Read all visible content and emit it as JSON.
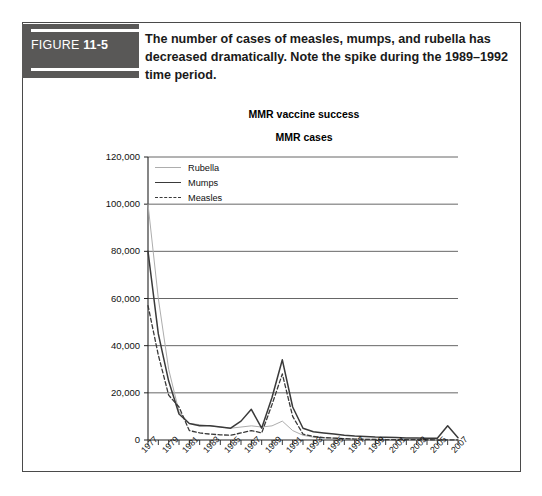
{
  "figure": {
    "label_word": "FIGURE",
    "label_number": "11-5",
    "caption": "The number of cases of measles, mumps, and rubella has decreased dramatically. Note the spike during the 1989–1992 time period."
  },
  "colors": {
    "label_box": "#595857",
    "frame": "#4a4a4a",
    "rubella": "#adadad",
    "mumps": "#3a3a3a",
    "measles": "#3a3a3a",
    "gridline": "#555555",
    "text": "#111111"
  },
  "chart_data": {
    "type": "line",
    "title": "MMR vaccine success",
    "subtitle": "MMR cases",
    "xlabel": "",
    "ylabel": "",
    "ylim": [
      0,
      120000
    ],
    "ytick_values": [
      0,
      20000,
      40000,
      60000,
      80000,
      100000,
      120000
    ],
    "ytick_labels": [
      "0",
      "20,000",
      "40,000",
      "60,000",
      "80,000",
      "100,000",
      "120,000"
    ],
    "grid": true,
    "grid_axis": "y",
    "legend_position": "top-left-inside",
    "x": [
      1977,
      1978,
      1979,
      1980,
      1981,
      1982,
      1983,
      1984,
      1985,
      1986,
      1987,
      1988,
      1989,
      1990,
      1991,
      1992,
      1993,
      1994,
      1995,
      1996,
      1997,
      1998,
      1999,
      2000,
      2001,
      2002,
      2003,
      2004,
      2005,
      2006,
      2007
    ],
    "xtick_labels": [
      "1977",
      "1979",
      "1981",
      "1983",
      "1985",
      "1987",
      "1989",
      "1991",
      "1993",
      "1995",
      "1997",
      "1999",
      "2001",
      "2003",
      "2005",
      "2007"
    ],
    "xtick_values": [
      1977,
      1979,
      1981,
      1983,
      1985,
      1987,
      1989,
      1991,
      1993,
      1995,
      1997,
      1999,
      2001,
      2003,
      2005,
      2007
    ],
    "series": [
      {
        "name": "Rubella",
        "style": "solid-light",
        "values": [
          100000,
          60000,
          30000,
          12000,
          7000,
          6500,
          6000,
          5500,
          5000,
          5500,
          6000,
          5500,
          6000,
          8000,
          4000,
          2000,
          1200,
          900,
          800,
          600,
          400,
          350,
          300,
          250,
          200,
          150,
          120,
          100,
          90,
          80,
          70
        ]
      },
      {
        "name": "Mumps",
        "style": "solid-dark",
        "values": [
          80000,
          45000,
          25000,
          11000,
          7000,
          6000,
          6000,
          5500,
          5000,
          8000,
          13000,
          5000,
          18000,
          34000,
          14000,
          5000,
          3500,
          3000,
          2500,
          2000,
          1700,
          1500,
          1300,
          1200,
          1100,
          900,
          800,
          700,
          700,
          6000,
          1000
        ]
      },
      {
        "name": "Measles",
        "style": "dashed-dark",
        "values": [
          57000,
          36000,
          19000,
          14000,
          4000,
          3000,
          2500,
          2200,
          2000,
          3000,
          4000,
          3000,
          15000,
          28000,
          10000,
          2500,
          1500,
          1000,
          800,
          600,
          400,
          300,
          250,
          200,
          180,
          150,
          120,
          100,
          90,
          80,
          70
        ]
      }
    ]
  }
}
